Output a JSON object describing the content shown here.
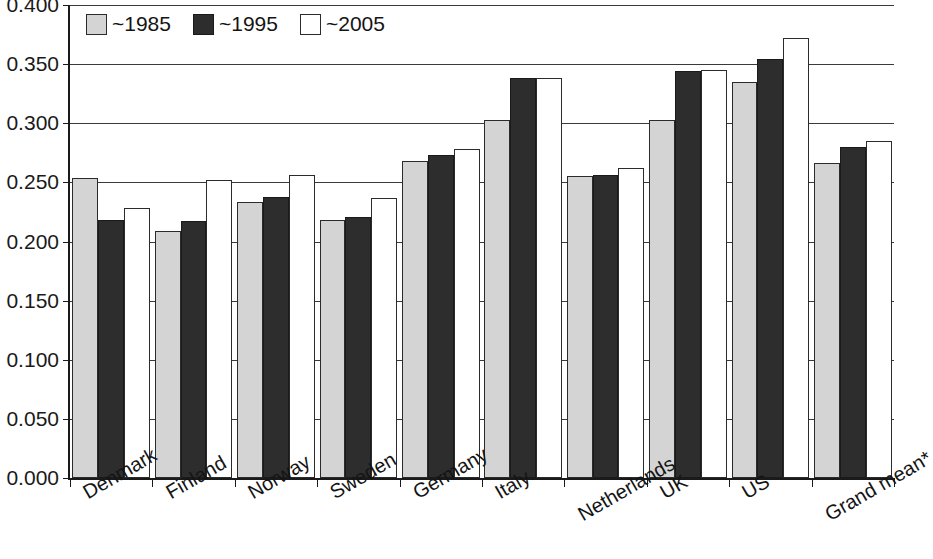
{
  "chart_data": {
    "type": "bar",
    "title": "",
    "xlabel": "",
    "ylabel": "",
    "ylim": [
      0.0,
      0.4
    ],
    "ytick_values": [
      0.4,
      0.35,
      0.3,
      0.25,
      0.2,
      0.15,
      0.1,
      0.05,
      0.0
    ],
    "ytick_labels": [
      "0.400",
      "0.350",
      "0.300",
      "0.250",
      "0.200",
      "0.150",
      "0.100",
      "0.050",
      "0.000"
    ],
    "grid": true,
    "legend_position": "top-left",
    "categories": [
      "Denmark",
      "Finland",
      "Norway",
      "Sweden",
      "Germany",
      "Italy",
      "Netherlands",
      "UK",
      "US",
      "Grand mean*"
    ],
    "series": [
      {
        "name": "~1985",
        "color": "#d4d4d4",
        "values": [
          0.254,
          0.209,
          0.233,
          0.218,
          0.268,
          0.303,
          0.255,
          0.303,
          0.335,
          0.266
        ]
      },
      {
        "name": "~1995",
        "color": "#2d2d2d",
        "values": [
          0.218,
          0.217,
          0.238,
          0.221,
          0.273,
          0.338,
          0.256,
          0.344,
          0.354,
          0.28
        ]
      },
      {
        "name": "~2005",
        "color": "#ffffff",
        "values": [
          0.228,
          0.252,
          0.256,
          0.237,
          0.278,
          0.338,
          0.262,
          0.345,
          0.372,
          0.285
        ]
      }
    ]
  },
  "legend": {
    "items": [
      {
        "label": "~1985",
        "swatch": "light-gray-swatch"
      },
      {
        "label": "~1995",
        "swatch": "dark-swatch"
      },
      {
        "label": "~2005",
        "swatch": "white-swatch"
      }
    ]
  }
}
